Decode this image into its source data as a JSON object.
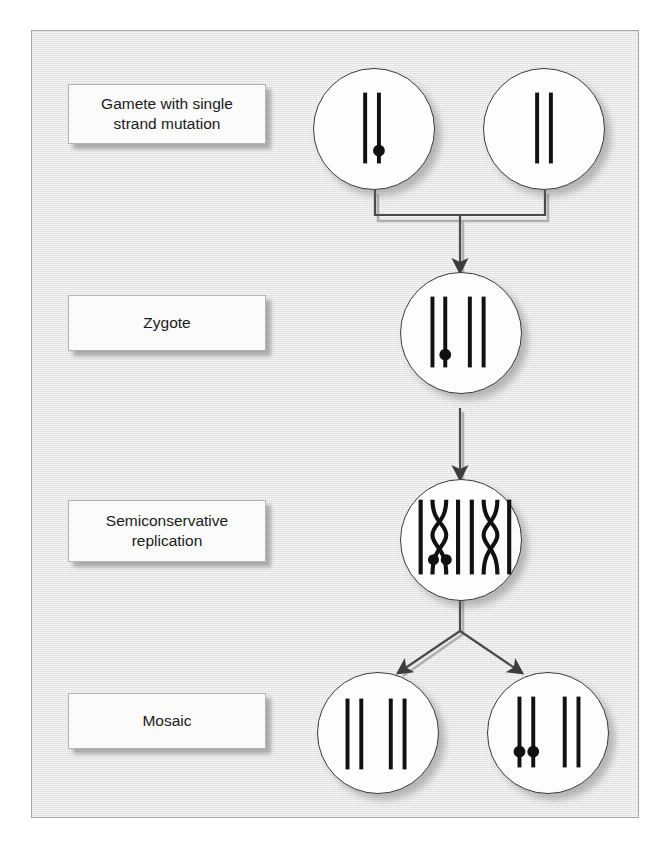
{
  "figure": {
    "background_color": "#e6e6e6",
    "page_color": "#ffffff",
    "border_color": "#a8a8a8",
    "chromosome_color": "#111111",
    "mutation_marker_color": "#111111",
    "cell_fill": "#fdfdfd",
    "cell_border": "#3a3a3a",
    "arrow_color": "#3d3d3d"
  },
  "labels": [
    {
      "id": "gamete",
      "text": "Gamete with single\nstrand mutation",
      "line1": "Gamete with single",
      "line2": "strand mutation"
    },
    {
      "id": "zygote",
      "text": "Zygote",
      "line1": "Zygote",
      "line2": ""
    },
    {
      "id": "replication",
      "text": "Semiconservative\nreplication",
      "line1": "Semiconservative",
      "line2": "replication"
    },
    {
      "id": "mosaic",
      "text": "Mosaic",
      "line1": "Mosaic",
      "line2": ""
    }
  ],
  "stages": [
    {
      "id": "gametes",
      "label": "Gamete with single strand mutation",
      "cells": [
        {
          "id": "gamete-maternal",
          "chromosome_groups": 1,
          "strands": 2,
          "mutation_dots": 1,
          "dot_on_strand": 2,
          "shape": "straight"
        },
        {
          "id": "gamete-paternal",
          "chromosome_groups": 1,
          "strands": 2,
          "mutation_dots": 0,
          "dot_on_strand": 0,
          "shape": "straight"
        }
      ]
    },
    {
      "id": "zygote",
      "label": "Zygote",
      "cells": [
        {
          "id": "zygote-cell",
          "chromosome_groups": 2,
          "strands": 4,
          "mutation_dots": 1,
          "dot_on_strand": 2,
          "shape": "straight"
        }
      ]
    },
    {
      "id": "replication",
      "label": "Semiconservative replication",
      "cells": [
        {
          "id": "replicating-cell",
          "chromosome_groups": 2,
          "strands": 8,
          "mutation_dots": 2,
          "dot_on_strand": 0,
          "shape": "crossed"
        }
      ]
    },
    {
      "id": "mosaic",
      "label": "Mosaic",
      "cells": [
        {
          "id": "daughter-cell-normal",
          "chromosome_groups": 2,
          "strands": 4,
          "mutation_dots": 0,
          "dot_on_strand": 0,
          "shape": "straight"
        },
        {
          "id": "daughter-cell-mutant",
          "chromosome_groups": 2,
          "strands": 4,
          "mutation_dots": 2,
          "dot_on_strand": 0,
          "shape": "straight"
        }
      ]
    }
  ],
  "connectors": [
    {
      "id": "gametes-to-zygote",
      "type": "bracket-merge",
      "from": [
        "gamete-maternal",
        "gamete-paternal"
      ],
      "to": "zygote-cell",
      "arrowheads": 1
    },
    {
      "id": "zygote-to-replication",
      "type": "straight-arrow",
      "from": [
        "zygote-cell"
      ],
      "to": "replicating-cell",
      "arrowheads": 1
    },
    {
      "id": "replication-to-mosaic",
      "type": "split-arrows",
      "from": [
        "replicating-cell"
      ],
      "to": "daughter-cells",
      "arrowheads": 2
    }
  ]
}
